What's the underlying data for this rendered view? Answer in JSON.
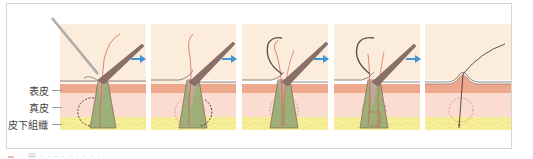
{
  "figure": {
    "type": "hair-implant-procedure-sequence",
    "panels_count": 5,
    "arrow_color": "#3f95d6"
  },
  "layers": {
    "epidermis": {
      "label": "表皮",
      "color": "#eea88e"
    },
    "dermis": {
      "label": "真皮",
      "color": "#fadcd0"
    },
    "subcutaneous": {
      "label": "皮下組織",
      "color": "#f7ee9a"
    }
  },
  "colors": {
    "background_upper": "#fcecdc",
    "surface_line": "#7a6a62",
    "follicle_fill": "#9cb07a",
    "follicle_outline": "#8a6b5c",
    "hair_red": "#d6543e",
    "instrument": "#8a6f68",
    "dashed_circle": "#d98080"
  },
  "caption": {
    "text": "図 · · · · · · · · ·"
  }
}
